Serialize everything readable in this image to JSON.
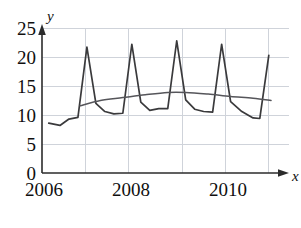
{
  "chart_data": {
    "type": "line",
    "title": "",
    "subtitle": "",
    "xlabel": "x",
    "ylabel": "y",
    "xlim": [
      2006,
      2011.5
    ],
    "ylim": [
      0,
      25
    ],
    "grid": true,
    "legend": "none",
    "y_ticks": [
      0,
      5,
      10,
      15,
      20,
      25
    ],
    "y_tick_labels": [
      "0",
      "5",
      "10",
      "15",
      "20",
      "25"
    ],
    "x_ticks": [
      2006,
      2007,
      2008,
      2009,
      2010,
      2011
    ],
    "x_tick_labels": [
      "2006",
      "",
      "2008",
      "",
      "2010",
      ""
    ],
    "x_labels_shown": [
      "2006",
      "2008",
      "2010"
    ],
    "series": [
      {
        "name": "observed",
        "style": "jagged-seasonal",
        "color": "#3a3a3c",
        "x": [
          2006.15,
          2006.4,
          2006.6,
          2006.8,
          2007.0,
          2007.2,
          2007.4,
          2007.6,
          2007.8,
          2008.0,
          2008.2,
          2008.4,
          2008.6,
          2008.8,
          2009.0,
          2009.2,
          2009.4,
          2009.6,
          2009.8,
          2010.0,
          2010.2,
          2010.45,
          2010.7,
          2010.85,
          2011.05
        ],
        "values": [
          8.6,
          8.2,
          9.3,
          9.6,
          21.7,
          12.0,
          10.6,
          10.2,
          10.3,
          22.2,
          12.2,
          10.8,
          11.1,
          11.1,
          22.8,
          12.6,
          11.0,
          10.6,
          10.5,
          22.2,
          12.3,
          10.6,
          9.5,
          9.4,
          20.3
        ]
      },
      {
        "name": "trend",
        "style": "smooth",
        "color": "#55555a",
        "x": [
          2006.85,
          2007.3,
          2007.8,
          2008.3,
          2008.8,
          2009.2,
          2009.7,
          2010.2,
          2010.7,
          2011.1
        ],
        "values": [
          11.6,
          12.5,
          13.0,
          13.5,
          13.9,
          13.9,
          13.6,
          13.2,
          12.9,
          12.5
        ]
      }
    ],
    "annotations": []
  },
  "axes": {
    "y_axis_name": "y",
    "x_axis_name": "x"
  },
  "footer": {
    "caption_box": ""
  }
}
